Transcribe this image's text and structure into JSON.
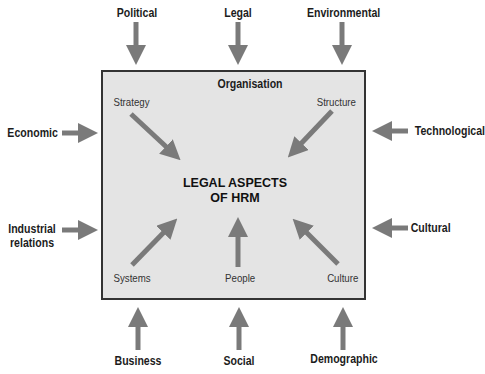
{
  "diagram": {
    "title": "Organisation",
    "center": {
      "line1": "LEGAL ASPECTS",
      "line2": "OF HRM"
    },
    "external_factors": {
      "top": [
        "Political",
        "Legal",
        "Environmental"
      ],
      "left": [
        "Economic",
        "Industrial relations"
      ],
      "right": [
        "Technological",
        "Cultural"
      ],
      "bottom": [
        "Business",
        "Social",
        "Demographic"
      ]
    },
    "internal_factors": [
      "Strategy",
      "Structure",
      "Systems",
      "People",
      "Culture"
    ],
    "colors": {
      "arrow": "#7a7a7a",
      "box_fill": "#e4e4e4",
      "box_border": "#333333",
      "text": "#1c1c1c"
    }
  }
}
